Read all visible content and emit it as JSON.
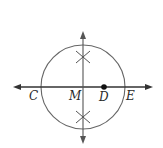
{
  "diagram": {
    "type": "geometric-construction",
    "colors": {
      "stroke": "#555555",
      "line": "#333333",
      "point": "#111111",
      "label": "#2a2a2a"
    },
    "labels": {
      "C": "C",
      "M": "M",
      "D": "D",
      "E": "E"
    },
    "points": [
      {
        "name": "C",
        "label": "C"
      },
      {
        "name": "M",
        "label": "M"
      },
      {
        "name": "D",
        "label": "D",
        "filled_dot": true
      },
      {
        "name": "E",
        "label": "E"
      }
    ],
    "elements": [
      {
        "type": "circle",
        "center": "M"
      },
      {
        "type": "line",
        "orientation": "horizontal",
        "through": [
          "C",
          "M",
          "D",
          "E"
        ],
        "arrows": "both"
      },
      {
        "type": "line",
        "orientation": "vertical",
        "through": [
          "M"
        ],
        "arrows": "both"
      },
      {
        "type": "arc-mark",
        "position": "above M",
        "shape": "X"
      },
      {
        "type": "arc-mark",
        "position": "below M",
        "shape": "X"
      }
    ]
  }
}
